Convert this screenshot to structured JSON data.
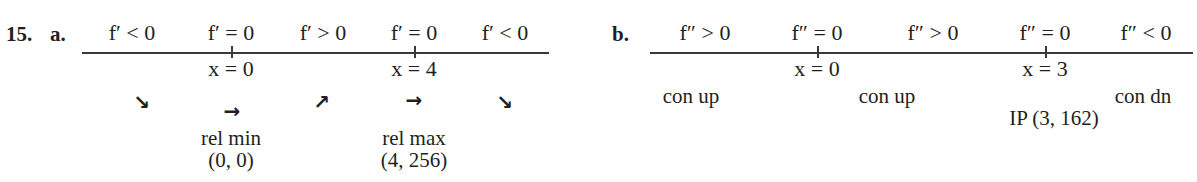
{
  "problem": {
    "number": "15.",
    "part_a": {
      "label": "a.",
      "conditions": [
        "f′ < 0",
        "f′ = 0",
        "f′ > 0",
        "f′ = 0",
        "f′ < 0"
      ],
      "critical_points": [
        "x = 0",
        "x = 4"
      ],
      "arrows": [
        "↘",
        "→",
        "↗",
        "→",
        "↘"
      ],
      "arrow_names": [
        "decreasing",
        "horizontal",
        "increasing",
        "horizontal",
        "decreasing"
      ],
      "extrema": [
        {
          "type": "rel min",
          "point": "(0, 0)"
        },
        {
          "type": "rel max",
          "point": "(4, 256)"
        }
      ]
    },
    "part_b": {
      "label": "b.",
      "conditions": [
        "f″ > 0",
        "f″ = 0",
        "f″ > 0",
        "f″ = 0",
        "f″ < 0"
      ],
      "critical_points": [
        "x = 0",
        "x = 3"
      ],
      "concavity": [
        "con up",
        "con up",
        "con dn"
      ],
      "inflection": "IP (3, 162)"
    }
  }
}
